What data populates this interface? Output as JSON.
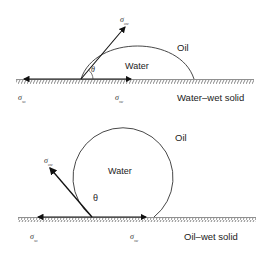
{
  "top_diagram": {
    "phase_outer": "Oil",
    "phase_drop": "Water",
    "angle_symbol": "θ",
    "surface_label": "Water–wet solid",
    "tension_up": {
      "symbol": "σ",
      "sub": "ow"
    },
    "tension_left": {
      "symbol": "σ",
      "sub": "so"
    },
    "tension_right": {
      "symbol": "σ",
      "sub": "sw"
    }
  },
  "bottom_diagram": {
    "phase_outer": "Oil",
    "phase_drop": "Water",
    "angle_symbol": "θ",
    "surface_label": "Oil–wet solid",
    "tension_up": {
      "symbol": "σ",
      "sub": "ow"
    },
    "tension_left": {
      "symbol": "σ",
      "sub": "so"
    },
    "tension_right": {
      "symbol": "σ",
      "sub": "sw"
    }
  },
  "colors": {
    "line": "#222222",
    "hatch": "#555555"
  }
}
